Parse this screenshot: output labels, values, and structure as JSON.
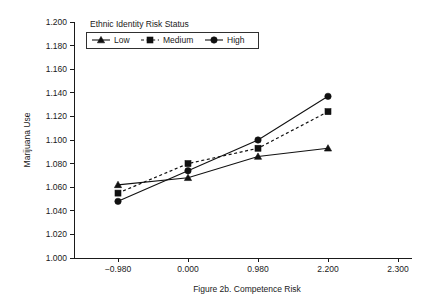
{
  "chart_data": {
    "type": "line",
    "title": "",
    "xlabel": "Figure 2b. Competence Risk",
    "ylabel": "Marijuana Use",
    "categories": [
      "-0.980",
      "0.000",
      "0.980",
      "2.200",
      "2.300"
    ],
    "x_tick_labels": [
      "−0.980",
      "0.000",
      "0.980",
      "2.200",
      "2.300"
    ],
    "y_tick_labels": [
      "1.000",
      "1.020",
      "1.040",
      "1.060",
      "1.080",
      "1.100",
      "1.120",
      "1.140",
      "1.160",
      "1.180",
      "1.200"
    ],
    "y_tick_values": [
      1.0,
      1.02,
      1.04,
      1.06,
      1.08,
      1.1,
      1.12,
      1.14,
      1.16,
      1.18,
      1.2
    ],
    "ylim": [
      1.0,
      1.2
    ],
    "grid": false,
    "legend_position": "top-left-inside",
    "legend_title": "Ethnic Identity Risk Status",
    "series": [
      {
        "name": "Low",
        "marker": "triangle",
        "line_style": "solid",
        "color": "#111111",
        "x": [
          "-0.980",
          "0.000",
          "0.980",
          "2.200"
        ],
        "values": [
          1.062,
          1.068,
          1.086,
          1.093
        ]
      },
      {
        "name": "Medium",
        "marker": "square",
        "line_style": "dashed",
        "color": "#111111",
        "x": [
          "-0.980",
          "0.000",
          "0.980",
          "2.200"
        ],
        "values": [
          1.055,
          1.08,
          1.093,
          1.124
        ]
      },
      {
        "name": "High",
        "marker": "circle",
        "line_style": "solid",
        "color": "#111111",
        "x": [
          "-0.980",
          "0.000",
          "0.980",
          "2.200"
        ],
        "values": [
          1.048,
          1.074,
          1.1,
          1.137
        ]
      }
    ]
  },
  "figure": {
    "caption": "Figure 2b. Competence Risk",
    "y_axis_title": "Marijuana Use",
    "legend_title": "Ethnic Identity Risk Status",
    "legend_items": [
      {
        "label": "Low"
      },
      {
        "label": "Medium"
      },
      {
        "label": "High"
      }
    ]
  }
}
